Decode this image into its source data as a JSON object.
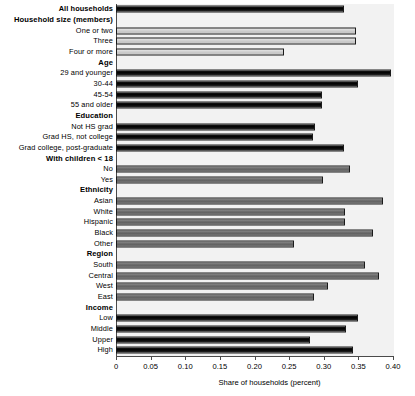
{
  "chart_data": {
    "type": "bar",
    "orientation": "horizontal",
    "title": "",
    "xlabel": "Share of households (percent)",
    "ylabel": "",
    "xlim": [
      0,
      0.4
    ],
    "xticks": [
      0,
      0.05,
      0.1,
      0.15,
      0.2,
      0.25,
      0.3,
      0.35,
      0.4
    ],
    "xtick_labels": [
      "0",
      "0.05",
      "0.10",
      "0.15",
      "0.20",
      "0.25",
      "0.30",
      "0.35",
      "0.40"
    ],
    "grid": false,
    "legend": "none",
    "plot_background": "#f2f2f2",
    "colors": {
      "dark": "#101010",
      "mid": "#6f6f6f",
      "light": "#d2d2d2"
    },
    "rows": [
      {
        "label": "All households",
        "header": false,
        "bold": true,
        "value": 0.329,
        "shade": "dark"
      },
      {
        "label": "Household size (members)",
        "header": true,
        "bold": true,
        "value": null,
        "shade": "none"
      },
      {
        "label": "One or two",
        "header": false,
        "bold": false,
        "value": 0.346,
        "shade": "light"
      },
      {
        "label": "Three",
        "header": false,
        "bold": false,
        "value": 0.346,
        "shade": "light"
      },
      {
        "label": "Four or more",
        "header": false,
        "bold": false,
        "value": 0.242,
        "shade": "light"
      },
      {
        "label": "Age",
        "header": true,
        "bold": true,
        "value": null,
        "shade": "none"
      },
      {
        "label": "29 and younger",
        "header": false,
        "bold": false,
        "value": 0.397,
        "shade": "dark"
      },
      {
        "label": "30-44",
        "header": false,
        "bold": false,
        "value": 0.349,
        "shade": "dark"
      },
      {
        "label": "45-54",
        "header": false,
        "bold": false,
        "value": 0.297,
        "shade": "dark"
      },
      {
        "label": "55 and older",
        "header": false,
        "bold": false,
        "value": 0.297,
        "shade": "dark"
      },
      {
        "label": "Education",
        "header": true,
        "bold": true,
        "value": null,
        "shade": "none"
      },
      {
        "label": "Not HS grad",
        "header": false,
        "bold": false,
        "value": 0.287,
        "shade": "dark"
      },
      {
        "label": "Grad HS, not college",
        "header": false,
        "bold": false,
        "value": 0.285,
        "shade": "dark"
      },
      {
        "label": "Grad college, post-graduate",
        "header": false,
        "bold": false,
        "value": 0.329,
        "shade": "dark"
      },
      {
        "label": "With children < 18",
        "header": true,
        "bold": true,
        "value": null,
        "shade": "none"
      },
      {
        "label": "No",
        "header": false,
        "bold": false,
        "value": 0.338,
        "shade": "mid"
      },
      {
        "label": "Yes",
        "header": false,
        "bold": false,
        "value": 0.299,
        "shade": "mid"
      },
      {
        "label": "Ethnicity",
        "header": true,
        "bold": true,
        "value": null,
        "shade": "none"
      },
      {
        "label": "Asian",
        "header": false,
        "bold": false,
        "value": 0.386,
        "shade": "mid"
      },
      {
        "label": "White",
        "header": false,
        "bold": false,
        "value": 0.33,
        "shade": "mid"
      },
      {
        "label": "Hispanic",
        "header": false,
        "bold": false,
        "value": 0.33,
        "shade": "mid"
      },
      {
        "label": "Black",
        "header": false,
        "bold": false,
        "value": 0.371,
        "shade": "mid"
      },
      {
        "label": "Other",
        "header": false,
        "bold": false,
        "value": 0.257,
        "shade": "mid"
      },
      {
        "label": "Region",
        "header": true,
        "bold": true,
        "value": null,
        "shade": "none"
      },
      {
        "label": "South",
        "header": false,
        "bold": false,
        "value": 0.36,
        "shade": "mid"
      },
      {
        "label": "Central",
        "header": false,
        "bold": false,
        "value": 0.38,
        "shade": "mid"
      },
      {
        "label": "West",
        "header": false,
        "bold": false,
        "value": 0.306,
        "shade": "mid"
      },
      {
        "label": "East",
        "header": false,
        "bold": false,
        "value": 0.286,
        "shade": "mid"
      },
      {
        "label": "Income",
        "header": true,
        "bold": true,
        "value": null,
        "shade": "none"
      },
      {
        "label": "Low",
        "header": false,
        "bold": false,
        "value": 0.349,
        "shade": "dark"
      },
      {
        "label": "Middle",
        "header": false,
        "bold": false,
        "value": 0.332,
        "shade": "dark"
      },
      {
        "label": "Upper",
        "header": false,
        "bold": false,
        "value": 0.28,
        "shade": "dark"
      },
      {
        "label": "High",
        "header": false,
        "bold": false,
        "value": 0.342,
        "shade": "dark"
      }
    ]
  }
}
